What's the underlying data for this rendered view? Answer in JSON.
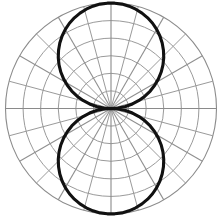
{
  "figure": {
    "kind": "polar-plot",
    "title": "",
    "background_color": "#ffffff"
  },
  "chart_data": {
    "type": "line",
    "subtype": "polar",
    "title": "",
    "subtitle": "",
    "xlabel": "",
    "ylabel": "",
    "legend": [],
    "legend_position": "none",
    "grid": true,
    "annotations": [],
    "polar": {
      "center_x": 111,
      "center_y": 108.5,
      "outer_radius": 105.5,
      "theta_direction": "counterclockwise",
      "theta_zero_location": "E",
      "rlim": [
        0,
        1
      ],
      "r_rings": [
        0.1667,
        0.3333,
        0.5,
        0.6667,
        0.8333,
        1.0
      ],
      "ring_count": 6,
      "spoke_step_deg": 15,
      "spoke_major_step_deg": 30,
      "spoke_angles_deg": [
        0,
        15,
        30,
        45,
        60,
        75,
        90,
        105,
        120,
        135,
        150,
        165,
        180,
        195,
        210,
        225,
        240,
        255,
        270,
        285,
        300,
        315,
        330,
        345
      ],
      "tick_labels": [],
      "r_tick_labels": []
    },
    "series": [
      {
        "name": "radiation-pattern",
        "color": "#111111",
        "line_width": 3.1,
        "closed": true,
        "theta_deg": [
          0,
          4,
          8,
          12,
          16,
          20,
          24,
          28,
          32,
          36,
          40,
          44,
          48,
          52,
          56,
          60,
          64,
          68,
          72,
          76,
          80,
          84,
          88,
          92,
          96,
          100,
          104,
          108,
          112,
          116,
          120,
          124,
          128,
          132,
          136,
          140,
          144,
          148,
          152,
          156,
          160,
          164,
          168,
          172,
          176,
          180,
          184,
          188,
          192,
          196,
          200,
          204,
          208,
          212,
          216,
          220,
          224,
          228,
          232,
          236,
          240,
          244,
          248,
          252,
          256,
          260,
          264,
          268,
          272,
          276,
          280,
          284,
          288,
          292,
          296,
          300,
          304,
          308,
          312,
          316,
          320,
          324,
          328,
          332,
          336,
          340,
          344,
          348,
          352,
          356,
          360
        ],
        "r_values": [
          0.0,
          0.07,
          0.139,
          0.208,
          0.276,
          0.342,
          0.407,
          0.469,
          0.53,
          0.588,
          0.643,
          0.695,
          0.743,
          0.788,
          0.829,
          0.866,
          0.899,
          0.927,
          0.951,
          0.97,
          0.985,
          0.995,
          0.999,
          0.999,
          0.995,
          0.985,
          0.97,
          0.951,
          0.927,
          0.899,
          0.866,
          0.829,
          0.788,
          0.743,
          0.695,
          0.643,
          0.588,
          0.53,
          0.469,
          0.407,
          0.342,
          0.276,
          0.208,
          0.139,
          0.07,
          0.0,
          0.07,
          0.139,
          0.208,
          0.276,
          0.342,
          0.407,
          0.469,
          0.53,
          0.588,
          0.643,
          0.695,
          0.743,
          0.788,
          0.829,
          0.866,
          0.899,
          0.927,
          0.951,
          0.97,
          0.985,
          0.995,
          0.999,
          0.999,
          0.995,
          0.985,
          0.97,
          0.951,
          0.927,
          0.899,
          0.866,
          0.829,
          0.788,
          0.743,
          0.695,
          0.643,
          0.588,
          0.53,
          0.469,
          0.407,
          0.342,
          0.276,
          0.208,
          0.139,
          0.07,
          0.0
        ],
        "shape_description": "figure-eight dipole lobes, maxima at 90 and 270 degrees, nulls at 0 and 180 degrees"
      }
    ],
    "colors": {
      "curve": "#111111",
      "grid": "#9a9a9a",
      "axis": "#8a8a8a",
      "background": "#ffffff"
    }
  }
}
